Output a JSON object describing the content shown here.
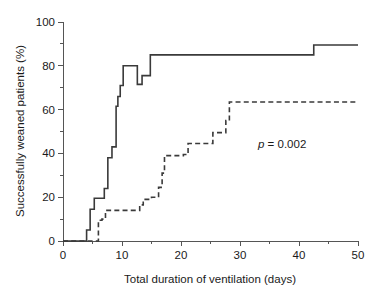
{
  "chart_data": {
    "type": "line",
    "subtype": "kaplan-meier-step",
    "title": "",
    "xlabel": "Total duration of ventilation (days)",
    "ylabel": "Successfully weaned patients (%)",
    "xlim": [
      0,
      50
    ],
    "ylim": [
      0,
      100
    ],
    "xticks": [
      0,
      10,
      20,
      30,
      40,
      50
    ],
    "xticklabels": [
      "0",
      "10",
      "20",
      "30",
      "40",
      "50"
    ],
    "xminorticks": [
      5,
      15,
      25,
      35,
      45
    ],
    "yticks": [
      0,
      20,
      40,
      60,
      80,
      100
    ],
    "yticklabels": [
      "0",
      "20",
      "40",
      "60",
      "80",
      "100"
    ],
    "yminorticks": [
      10,
      30,
      50,
      70,
      90
    ],
    "grid": false,
    "legend": null,
    "annotations": [
      {
        "name": "p-value",
        "text_italic": "p",
        "text_rest": " = 0.002",
        "text": "p = 0.002",
        "x": 33.5,
        "y": 45
      }
    ],
    "series": [
      {
        "name": "solid-curve",
        "style": "solid",
        "color": "#3a3a3a",
        "x": [
          0,
          4.0,
          4.0,
          4.6,
          4.6,
          5.3,
          5.3,
          7.0,
          7.0,
          7.6,
          7.6,
          8.3,
          8.3,
          9.0,
          9.0,
          9.3,
          9.3,
          9.7,
          9.7,
          10.2,
          10.2,
          11.0,
          11.0,
          12.6,
          12.6,
          13.4,
          13.4,
          14.8,
          14.8,
          42.5,
          42.5,
          50.0
        ],
        "y": [
          0,
          0,
          5,
          5,
          14.5,
          14.5,
          19.5,
          19.5,
          24,
          24,
          38,
          38,
          43,
          43,
          61.5,
          61.5,
          66,
          66,
          71,
          71,
          80,
          80,
          80,
          80,
          71.5,
          71.5,
          75.5,
          75.5,
          85,
          85,
          89.5,
          89.5
        ],
        "steps": [
          {
            "day": 4.0,
            "percent": 5
          },
          {
            "day": 4.6,
            "percent": 14.5
          },
          {
            "day": 5.3,
            "percent": 19.5
          },
          {
            "day": 7.0,
            "percent": 24
          },
          {
            "day": 7.6,
            "percent": 38
          },
          {
            "day": 8.3,
            "percent": 43
          },
          {
            "day": 9.0,
            "percent": 61.5
          },
          {
            "day": 9.3,
            "percent": 66
          },
          {
            "day": 9.7,
            "percent": 71
          },
          {
            "day": 10.2,
            "percent": 80
          },
          {
            "day": 12.6,
            "percent": 71.5
          },
          {
            "day": 13.4,
            "percent": 75.5
          },
          {
            "day": 14.8,
            "percent": 85
          },
          {
            "day": 42.5,
            "percent": 89.5
          }
        ],
        "plateau_percent": 89.5
      },
      {
        "name": "dashed-curve",
        "style": "dashed",
        "color": "#3a3a3a",
        "x": [
          0,
          6.0,
          6.0,
          6.6,
          6.6,
          7.2,
          7.2,
          13.0,
          13.0,
          13.6,
          13.6,
          15.0,
          15.0,
          16.2,
          16.2,
          16.8,
          16.8,
          17.2,
          17.2,
          20.4,
          20.4,
          21.2,
          21.2,
          24.6,
          24.6,
          25.4,
          25.4,
          27.6,
          27.6,
          28.2,
          28.2,
          50.0
        ],
        "y": [
          0,
          0,
          9.5,
          9.5,
          10,
          10,
          14,
          14,
          16.5,
          16.5,
          19,
          19,
          20,
          20,
          24.5,
          24.5,
          31,
          31,
          39,
          39,
          39.5,
          39.5,
          44.5,
          44.5,
          44.5,
          44.5,
          49.5,
          49.5,
          55,
          55,
          63.5,
          63.5
        ],
        "steps": [
          {
            "day": 6.0,
            "percent": 9.5
          },
          {
            "day": 6.6,
            "percent": 10
          },
          {
            "day": 7.2,
            "percent": 14
          },
          {
            "day": 13.0,
            "percent": 16.5
          },
          {
            "day": 13.6,
            "percent": 19
          },
          {
            "day": 15.0,
            "percent": 20
          },
          {
            "day": 16.2,
            "percent": 24.5
          },
          {
            "day": 16.8,
            "percent": 31
          },
          {
            "day": 17.2,
            "percent": 39
          },
          {
            "day": 20.4,
            "percent": 39.5
          },
          {
            "day": 21.2,
            "percent": 44.5
          },
          {
            "day": 25.4,
            "percent": 49.5
          },
          {
            "day": 27.6,
            "percent": 55
          },
          {
            "day": 28.2,
            "percent": 63.5
          }
        ],
        "plateau_percent": 63.5
      }
    ]
  },
  "colors": {
    "background": "#ffffff",
    "axis": "#555555",
    "line": "#3a3a3a",
    "text": "#1a1a1a"
  }
}
